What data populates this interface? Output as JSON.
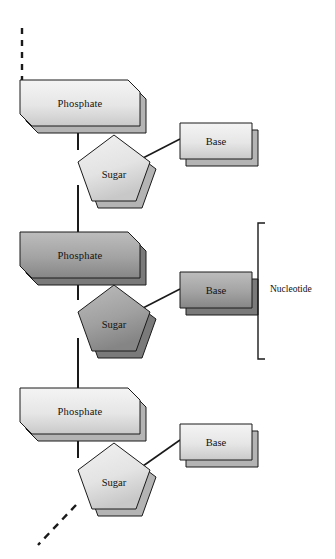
{
  "diagram": {
    "type": "biology-structure-diagram",
    "background_color": "#ffffff",
    "annotation": {
      "bracket_label": "Nucleotide",
      "bracket_spans": "middle repeating unit (phosphate + sugar + base)"
    },
    "colors": {
      "normal_fill_light": "#eeeeee",
      "normal_fill_dark": "#c9c9c9",
      "normal_depth": "#b4b4b4",
      "highlight_fill_light": "#b3b3b3",
      "highlight_fill_dark": "#8a8a8a",
      "highlight_depth": "#7a7a7a",
      "outline": "#1a1a1a",
      "line": "#1a1a1a"
    },
    "units": [
      {
        "id": "unit-top",
        "highlighted": false,
        "phosphate_label": "Phosphate",
        "sugar_label": "Sugar",
        "base_label": "Base"
      },
      {
        "id": "unit-middle",
        "highlighted": true,
        "phosphate_label": "Phosphate",
        "sugar_label": "Sugar",
        "base_label": "Base"
      },
      {
        "id": "unit-bottom",
        "highlighted": false,
        "phosphate_label": "Phosphate",
        "sugar_label": "Sugar",
        "base_label": "Base"
      }
    ],
    "strand_continues_top": true,
    "strand_continues_bottom": true
  }
}
